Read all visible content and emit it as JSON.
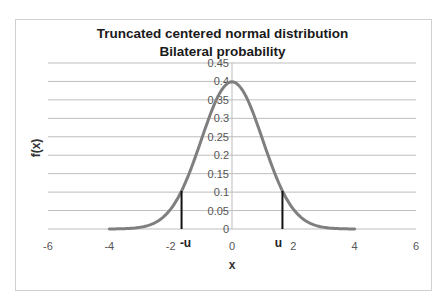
{
  "chart_data": {
    "type": "line",
    "title": "Truncated centered normal distribution",
    "subtitle": "Bilateral probability",
    "xlabel": "x",
    "ylabel": "f(x)",
    "xlim": [
      -6,
      6
    ],
    "ylim": [
      0,
      0.45
    ],
    "x_ticks": [
      "-6",
      "-4",
      "-2",
      "0",
      "2",
      "4",
      "6"
    ],
    "y_ticks": [
      "0",
      "0.05",
      "0.1",
      "0.15",
      "0.2",
      "0.25",
      "0.3",
      "0.35",
      "0.4",
      "0.45"
    ],
    "grid": "horizontal",
    "series": [
      {
        "name": "f(x) standard normal density",
        "color": "#7f7f7f",
        "x_range": [
          -4,
          4
        ],
        "x": [
          -4,
          -3.5,
          -3,
          -2.5,
          -2,
          -1.5,
          -1,
          -0.5,
          0,
          0.5,
          1,
          1.5,
          2,
          2.5,
          3,
          3.5,
          4
        ],
        "values": [
          0.0001,
          0.0009,
          0.0044,
          0.0175,
          0.054,
          0.1295,
          0.242,
          0.3521,
          0.3989,
          0.3521,
          0.242,
          0.1295,
          0.054,
          0.0175,
          0.0044,
          0.0009,
          0.0001
        ]
      }
    ],
    "annotations": [
      {
        "label": "-u",
        "x": -1.645,
        "y": 0.103,
        "type": "vertical-line"
      },
      {
        "label": "u",
        "x": 1.645,
        "y": 0.103,
        "type": "vertical-line"
      }
    ]
  }
}
